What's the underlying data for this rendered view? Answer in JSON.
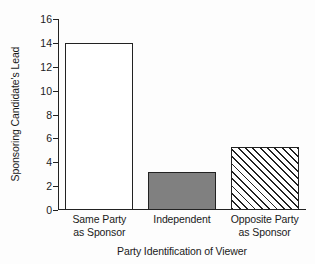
{
  "chart_data": {
    "type": "bar",
    "title": "",
    "subtitle": "",
    "xlabel": "Party Identification of Viewer",
    "ylabel": "Sponsoring Candidate's Lead",
    "categories": [
      "Same Party as Sponsor",
      "Independent",
      "Opposite Party as Sponsor"
    ],
    "category_lines": [
      [
        "Same Party",
        "as Sponsor"
      ],
      [
        "Independent"
      ],
      [
        "Opposite Party",
        "as Sponsor"
      ]
    ],
    "values": [
      14,
      3.2,
      5.3
    ],
    "ylim": [
      0,
      16
    ],
    "ytick_step": 2,
    "yticks": [
      0,
      2,
      4,
      6,
      8,
      10,
      12,
      14,
      16
    ],
    "ytick_labels": [
      "0",
      "2",
      "4",
      "6",
      "8",
      "10",
      "12",
      "14",
      "16"
    ],
    "xlim_categories": 3,
    "grid": false,
    "legend": null,
    "bar_styles": [
      "none",
      "solid-gray",
      "diagonal-hatch"
    ],
    "colors": {
      "bar_edge": "#222222",
      "bar_fill_none": "#ffffff",
      "bar_fill_gray": "#808080",
      "bar_hatch_line": "#222222",
      "axis": "#222222",
      "text": "#1a1a1a",
      "background": "#fdfdfd"
    }
  },
  "axes": {
    "y_title": "Sponsoring Candidate's Lead",
    "x_title": "Party Identification of Viewer"
  }
}
